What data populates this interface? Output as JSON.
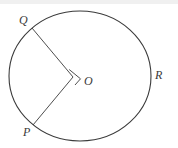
{
  "figure": {
    "background_color": "#ffffff",
    "stroke_color": "#3a3a3a",
    "label_color": "#3a3a3a",
    "top_band_color": "#f0f0f0",
    "labels": {
      "center": "O",
      "point_q": "Q",
      "point_p": "P",
      "point_r": "R"
    },
    "shapes": {
      "circle": {
        "name": "circle",
        "center_x": 80,
        "center_y": 76,
        "radius_x": 71,
        "radius_y": 65
      },
      "radius_oq": {
        "name": "radius-oq",
        "x1": 73,
        "y1": 77,
        "x2": 32,
        "y2": 28
      },
      "radius_op": {
        "name": "radius-op",
        "x1": 73,
        "y1": 77,
        "x2": 33,
        "y2": 125
      },
      "right_angle_marker": {
        "name": "right-angle-marker",
        "points": "69.2,69.5 80.5,78.8 75.0,85.0"
      }
    }
  }
}
